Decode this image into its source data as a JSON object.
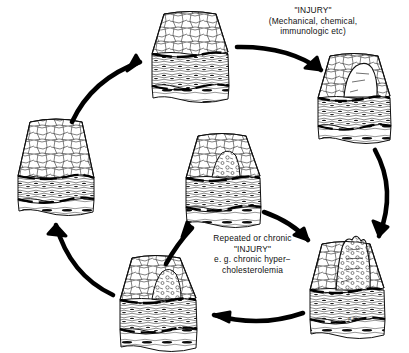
{
  "figure": {
    "width": 409,
    "height": 353,
    "background": "#ffffff",
    "ink": "#000000"
  },
  "captions": {
    "injury": "\"INJURY\"\n(Mechanical, chemical,\nimmunologic etc)",
    "repeated": "Repeated or chronic\n\"INJURY\"\ne. g. chronic hyper−\ncholesterolemia"
  },
  "signature": "R.Ross",
  "blocks": [
    {
      "name": "normal-vessel-wall",
      "position": "left",
      "x": 18,
      "y": 118,
      "w": 76,
      "h": 92,
      "state": "intact endothelium, normal intima and media"
    },
    {
      "name": "injured-endothelium",
      "position": "top",
      "x": 152,
      "y": 10,
      "w": 76,
      "h": 90,
      "state": "endothelial injury, intimal thickening"
    },
    {
      "name": "platelet-adhesion",
      "position": "top-right",
      "x": 318,
      "y": 52,
      "w": 72,
      "h": 90,
      "state": "focal endothelial denudation, platelet adhesion, smooth muscle migration"
    },
    {
      "name": "fibrous-plaque",
      "position": "bottom-right",
      "x": 310,
      "y": 235,
      "w": 78,
      "h": 100,
      "state": "raised fibrofatty plaque, proliferated smooth muscle, lipid core"
    },
    {
      "name": "regressed-lesion",
      "position": "bottom-center",
      "x": 120,
      "y": 253,
      "w": 78,
      "h": 96,
      "state": "lesion regression after injury ceases"
    },
    {
      "name": "intimal-thickening",
      "position": "center",
      "x": 186,
      "y": 132,
      "w": 76,
      "h": 94,
      "state": "persistent intimal smooth muscle thickening"
    }
  ],
  "arrows": [
    {
      "name": "arrow-left-to-top",
      "from": "normal-vessel-wall",
      "to": "injured-endothelium"
    },
    {
      "name": "arrow-top-to-topright",
      "from": "injured-endothelium",
      "to": "platelet-adhesion"
    },
    {
      "name": "arrow-topright-to-bottomright",
      "from": "platelet-adhesion",
      "to": "fibrous-plaque"
    },
    {
      "name": "arrow-bottomright-to-bottomcenter",
      "from": "fibrous-plaque",
      "to": "regressed-lesion"
    },
    {
      "name": "arrow-bottomcenter-to-left",
      "from": "regressed-lesion",
      "to": "normal-vessel-wall"
    },
    {
      "name": "arrow-bottomcenter-to-center",
      "from": "regressed-lesion",
      "to": "intimal-thickening"
    },
    {
      "name": "arrow-center-to-bottomright",
      "from": "intimal-thickening",
      "to": "fibrous-plaque"
    }
  ]
}
